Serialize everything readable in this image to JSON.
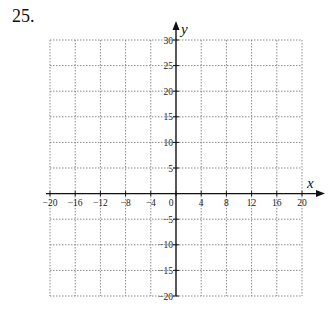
{
  "problem": {
    "number": "25."
  },
  "chart_data": {
    "type": "scatter",
    "title": "",
    "xlabel": "x",
    "ylabel": "y",
    "xlim": [
      -20,
      20
    ],
    "ylim": [
      -20,
      30
    ],
    "grid": true,
    "grid_style": "dotted",
    "x_ticks": [
      -20,
      -16,
      -12,
      -8,
      -4,
      0,
      4,
      8,
      12,
      16,
      20
    ],
    "x_tick_labels": [
      "−20",
      "−16",
      "−12",
      "−8",
      "−4",
      "0",
      "4",
      "8",
      "12",
      "16",
      "20"
    ],
    "y_ticks": [
      30,
      25,
      20,
      15,
      10,
      5,
      -5,
      -10,
      -15,
      -20
    ],
    "y_tick_labels": [
      "30",
      "25",
      "20",
      "15",
      "10",
      "5",
      "−5",
      "−10",
      "−15",
      "−20"
    ],
    "series": []
  },
  "colors": {
    "grid": "#8a8a8a",
    "axis": "#111111"
  }
}
